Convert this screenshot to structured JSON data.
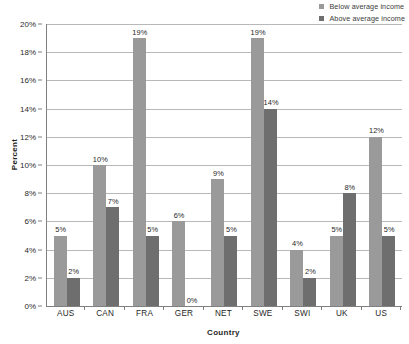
{
  "chart_data": {
    "type": "bar",
    "title": "",
    "subtitle": "",
    "xlabel": "Country",
    "ylabel": "Percent",
    "categories": [
      "AUS",
      "CAN",
      "FRA",
      "GER",
      "NET",
      "SWE",
      "SWI",
      "UK",
      "US"
    ],
    "series": [
      {
        "name": "Below average income",
        "color": "#9a9a9a",
        "values": [
          5,
          10,
          19,
          6,
          9,
          19,
          4,
          5,
          12
        ],
        "labels": [
          "5%",
          "10%",
          "19%",
          "6%",
          "9%",
          "19%",
          "4%",
          "5%",
          "12%"
        ]
      },
      {
        "name": "Above average income",
        "color": "#6e6e6e",
        "values": [
          2,
          7,
          5,
          0,
          5,
          14,
          2,
          8,
          5
        ],
        "labels": [
          "2%",
          "7%",
          "5%",
          "0%",
          "5%",
          "14%",
          "2%",
          "8%",
          "5%"
        ]
      }
    ],
    "ylim": [
      0,
      20
    ],
    "ytick_values": [
      0,
      2,
      4,
      6,
      8,
      10,
      12,
      14,
      16,
      18,
      20
    ],
    "ytick_labels": [
      "0%",
      "2%",
      "4%",
      "6%",
      "8%",
      "10%",
      "12%",
      "14%",
      "16%",
      "18%",
      "20%"
    ],
    "grid": "horizontal",
    "legend_position": "top-right",
    "value_labels": true
  },
  "legend": {
    "items": [
      {
        "label": "Below average income",
        "color": "#9a9a9a"
      },
      {
        "label": "Above average income",
        "color": "#6e6e6e"
      }
    ]
  },
  "axes": {
    "y_title": "Percent",
    "x_title": "Country"
  },
  "colors": {
    "series_below": "#9a9a9a",
    "series_above": "#6e6e6e",
    "gridline": "#b8b8b8",
    "axis": "#808080",
    "text": "#1f1f1f",
    "background": "#ffffff"
  }
}
